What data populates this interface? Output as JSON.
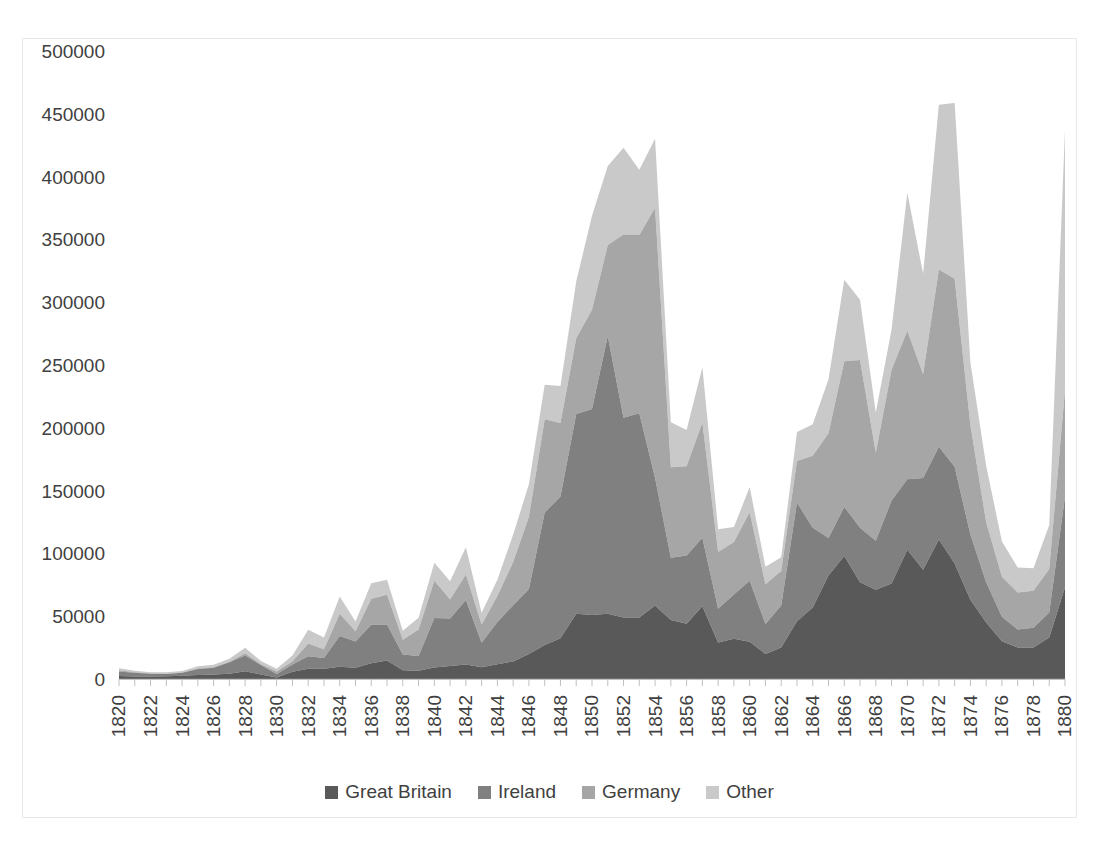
{
  "chart_data": {
    "type": "area",
    "stacked": true,
    "title": "",
    "subtitle": "",
    "xlabel": "",
    "ylabel": "",
    "xlim": [
      1820,
      1880
    ],
    "ylim": [
      0,
      500000
    ],
    "grid": false,
    "legend_position": "bottom",
    "y_ticks": [
      "0",
      "50000",
      "100000",
      "150000",
      "200000",
      "250000",
      "300000",
      "350000",
      "400000",
      "450000",
      "500000"
    ],
    "y_tick_values": [
      0,
      50000,
      100000,
      150000,
      200000,
      250000,
      300000,
      350000,
      400000,
      450000,
      500000
    ],
    "x_tick_labels": [
      "1820",
      "1822",
      "1824",
      "1826",
      "1828",
      "1830",
      "1832",
      "1834",
      "1836",
      "1838",
      "1840",
      "1842",
      "1844",
      "1846",
      "1848",
      "1850",
      "1852",
      "1854",
      "1856",
      "1858",
      "1860",
      "1862",
      "1864",
      "1866",
      "1868",
      "1870",
      "1872",
      "1874",
      "1876",
      "1878",
      "1880"
    ],
    "x": [
      1820,
      1821,
      1822,
      1823,
      1824,
      1825,
      1826,
      1827,
      1828,
      1829,
      1830,
      1831,
      1832,
      1833,
      1834,
      1835,
      1836,
      1837,
      1838,
      1839,
      1840,
      1841,
      1842,
      1843,
      1844,
      1845,
      1846,
      1847,
      1848,
      1849,
      1850,
      1851,
      1852,
      1853,
      1854,
      1855,
      1856,
      1857,
      1858,
      1859,
      1860,
      1861,
      1862,
      1863,
      1864,
      1865,
      1866,
      1867,
      1868,
      1869,
      1870,
      1871,
      1872,
      1873,
      1874,
      1875,
      1876,
      1877,
      1878,
      1879,
      1880
    ],
    "series": [
      {
        "name": "Great Britain",
        "color": "#595959",
        "values": [
          2410,
          2000,
          1900,
          2100,
          2600,
          3200,
          3500,
          4100,
          6200,
          3600,
          1200,
          5800,
          8200,
          8100,
          9800,
          8900,
          12500,
          14800,
          7000,
          6500,
          9100,
          10400,
          11500,
          9300,
          11800,
          14000,
          20000,
          27000,
          32500,
          52000,
          51000,
          52000,
          49000,
          49000,
          58500,
          47000,
          44000,
          58000,
          29000,
          32000,
          29700,
          20000,
          25000,
          46000,
          57000,
          82500,
          98000,
          77000,
          71000,
          76000,
          103000,
          87000,
          111000,
          92000,
          63000,
          45000,
          30000,
          25000,
          25000,
          33000,
          73000
        ],
        "final_value": 73000
      },
      {
        "name": "Ireland",
        "color": "#808080",
        "values": [
          3614,
          3000,
          2300,
          1900,
          2300,
          4800,
          5400,
          9200,
          12500,
          7500,
          2700,
          5800,
          9900,
          8600,
          24500,
          20900,
          30600,
          28500,
          12600,
          11800,
          39400,
          37700,
          51300,
          19600,
          33500,
          44800,
          51700,
          105500,
          112900,
          159000,
          164000,
          221000,
          159000,
          162600,
          101600,
          49600,
          54300,
          54400,
          26900,
          35200,
          48600,
          23800,
          33500,
          94400,
          63500,
          29700,
          39000,
          43500,
          39000,
          66200,
          56000,
          73000,
          74000,
          77000,
          52000,
          32000,
          19500,
          14500,
          15900,
          20000,
          72300
        ],
        "final_value": 72300
      },
      {
        "name": "Germany",
        "color": "#a6a6a6",
        "values": [
          968,
          400,
          150,
          180,
          230,
          450,
          511,
          432,
          1850,
          600,
          1976,
          2413,
          10194,
          6988,
          17686,
          8311,
          20707,
          23740,
          11683,
          21028,
          29704,
          15291,
          20370,
          14441,
          20731,
          34355,
          57561,
          74281,
          58465,
          60235,
          78896,
          72482,
          145918,
          141946,
          215009,
          71918,
          71028,
          91781,
          45310,
          41784,
          54491,
          31661,
          27529,
          33162,
          57276,
          83424,
          115892,
          133426,
          70126,
          104000,
          118225,
          82554,
          141109,
          149671,
          87000,
          47769,
          31937,
          29298,
          29313,
          34602,
          84638
        ],
        "final_value": 84638
      },
      {
        "name": "Other",
        "color": "#c9c9c9",
        "values": [
          1500,
          1200,
          1000,
          1100,
          1300,
          1700,
          1900,
          2400,
          4300,
          2600,
          2300,
          4700,
          10900,
          9400,
          13700,
          7600,
          12500,
          12000,
          7200,
          9400,
          14300,
          14500,
          21700,
          9500,
          12900,
          21900,
          25900,
          27500,
          29500,
          45200,
          75000,
          63000,
          69000,
          52000,
          55000,
          36000,
          29000,
          44000,
          18000,
          12000,
          20000,
          14000,
          11000,
          23000,
          25000,
          43000,
          65000,
          48000,
          32000,
          32000,
          110000,
          80000,
          131000,
          140000,
          50000,
          45000,
          28000,
          20000,
          18000,
          35000,
          207000
        ],
        "final_value": 207000
      }
    ]
  },
  "legend": {
    "items": [
      {
        "label": "Great Britain",
        "color": "#595959"
      },
      {
        "label": "Ireland",
        "color": "#808080"
      },
      {
        "label": "Germany",
        "color": "#a6a6a6"
      },
      {
        "label": "Other",
        "color": "#c9c9c9"
      }
    ]
  }
}
